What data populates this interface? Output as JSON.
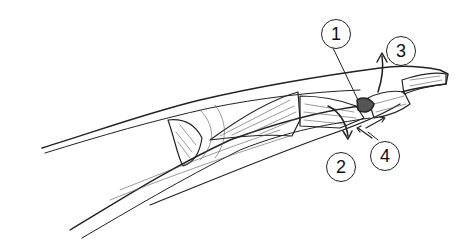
{
  "figure": {
    "colors": {
      "ink": "#222222",
      "background": "#ffffff"
    },
    "callouts": [
      {
        "number": "1",
        "x": 321,
        "y": 19
      },
      {
        "number": "2",
        "x": 326,
        "y": 152
      },
      {
        "number": "3",
        "x": 386,
        "y": 36
      },
      {
        "number": "4",
        "x": 370,
        "y": 141
      }
    ]
  }
}
